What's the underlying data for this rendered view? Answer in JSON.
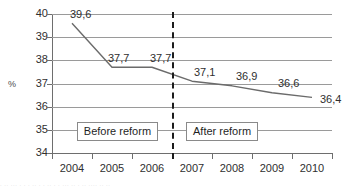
{
  "chart_data": {
    "type": "line",
    "title": "",
    "xlabel": "",
    "ylabel": "%",
    "categories": [
      "2004",
      "2005",
      "2006",
      "2007",
      "2008",
      "2009",
      "2010"
    ],
    "values": [
      39.6,
      37.7,
      37.7,
      37.1,
      36.9,
      36.6,
      36.4
    ],
    "data_labels": [
      "39,6",
      "37,7",
      "37,7",
      "37,1",
      "36,9",
      "36,6",
      "36,4"
    ],
    "ylim": [
      34,
      40
    ],
    "y_ticks": [
      40,
      39,
      38,
      37,
      36,
      35,
      34
    ],
    "y_tick_labels": [
      "40",
      "39",
      "38",
      "37",
      "36",
      "35",
      "34"
    ],
    "grid": true,
    "legend": "none",
    "series_color": "#6b6b6b",
    "gridline_color": "#9a9a9a",
    "annotations": [
      {
        "text": "Before reform",
        "type": "label-box"
      },
      {
        "text": "After reform",
        "type": "label-box"
      },
      {
        "text": "",
        "type": "vertical-dashed-divider",
        "between": "2006-2007"
      }
    ]
  },
  "footer": {
    "cropped_text": "· ·· ··· · · · ·· · · ·· · · ··· ·· · ·· ···· ·· ··"
  }
}
